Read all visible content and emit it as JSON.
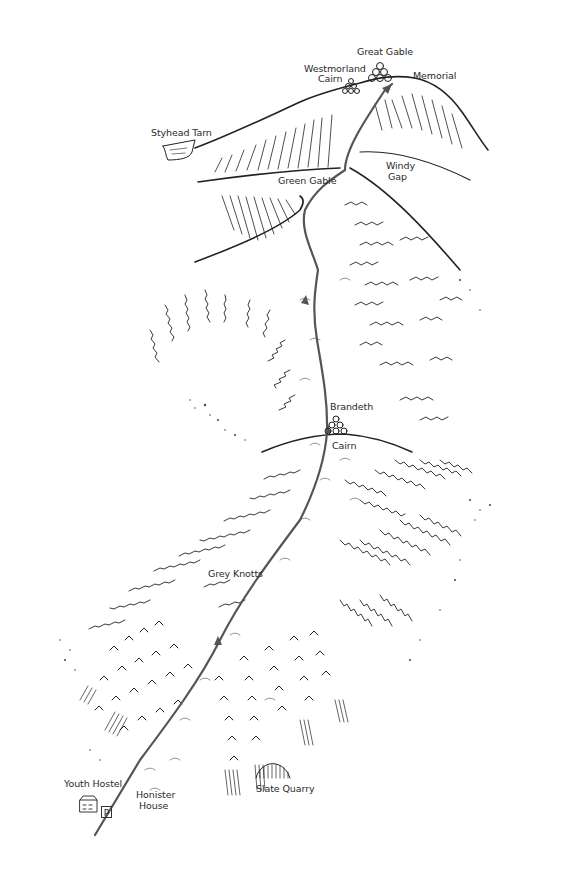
{
  "map": {
    "title": "Honister to Great Gable route",
    "route_color": "#555555",
    "ink_color": "#222222",
    "labels": {
      "great_gable": "Great Gable",
      "memorial": "Memorial",
      "westmorland_cairn_1": "Westmorland",
      "westmorland_cairn_2": "Cairn",
      "styhead_tarn": "Styhead Tarn",
      "green_gable": "Green Gable",
      "windy_gap_1": "Windy",
      "windy_gap_2": "Gap",
      "brandreth": "Brandeth",
      "brandreth_cairn": "Cairn",
      "grey_knotts": "Grey Knotts",
      "youth_hostel": "Youth Hostel",
      "honister_house_1": "Honister",
      "honister_house_2": "House",
      "slate_quarry": "Slate Quarry",
      "parking": "P"
    },
    "symbols": [
      {
        "name": "summit-cairn-great-gable",
        "type": "cairn"
      },
      {
        "name": "westmorland-cairn",
        "type": "cairn"
      },
      {
        "name": "brandreth-cairn",
        "type": "cairn"
      },
      {
        "name": "youth-hostel-building",
        "type": "building"
      },
      {
        "name": "parking",
        "type": "parking"
      },
      {
        "name": "slate-quarry",
        "type": "quarry"
      },
      {
        "name": "styhead-tarn",
        "type": "tarn"
      }
    ]
  }
}
